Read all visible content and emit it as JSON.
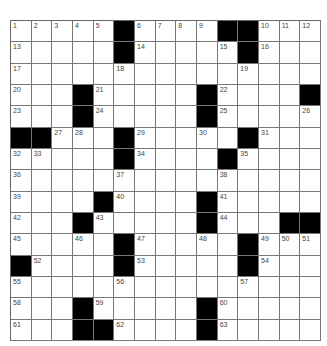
{
  "puzzle": {
    "rows": 15,
    "cols": 15,
    "colors": {
      "black": "#000000",
      "white": "#ffffff",
      "grid_line": "#777777",
      "number": "#444444"
    },
    "layout": [
      "11111011110001 11",
      "",
      "",
      "",
      "",
      "",
      "",
      "",
      "",
      "",
      "",
      "",
      "",
      "",
      ""
    ],
    "grid": [
      [
        1,
        2,
        3,
        4,
        5,
        "#",
        6,
        7,
        8,
        9,
        "#",
        "#",
        10,
        11,
        12
      ],
      [
        13,
        0,
        0,
        0,
        0,
        "#",
        14,
        0,
        0,
        0,
        15,
        "#",
        16,
        0,
        0
      ],
      [
        17,
        0,
        0,
        0,
        0,
        18,
        0,
        0,
        0,
        0,
        0,
        19,
        0,
        0,
        0
      ],
      [
        20,
        0,
        0,
        "#",
        21,
        0,
        0,
        0,
        0,
        "#",
        22,
        0,
        0,
        0,
        "#"
      ],
      [
        23,
        0,
        0,
        "#",
        24,
        0,
        0,
        0,
        0,
        "#",
        25,
        0,
        0,
        0,
        26
      ],
      [
        "#",
        "#",
        27,
        28,
        0,
        "#",
        29,
        0,
        0,
        30,
        0,
        "#",
        31,
        0,
        0
      ],
      [
        32,
        33,
        0,
        0,
        0,
        "#",
        34,
        0,
        0,
        0,
        "#",
        35,
        0,
        0,
        0
      ],
      [
        36,
        0,
        0,
        0,
        0,
        37,
        0,
        0,
        0,
        0,
        38,
        0,
        0,
        0,
        0
      ],
      [
        39,
        0,
        0,
        0,
        "#",
        40,
        0,
        0,
        0,
        "#",
        41,
        0,
        0,
        0,
        0
      ],
      [
        42,
        0,
        0,
        "#",
        43,
        0,
        0,
        0,
        0,
        "#",
        44,
        0,
        0,
        "#",
        "#"
      ],
      [
        45,
        0,
        0,
        46,
        0,
        "#",
        47,
        0,
        0,
        48,
        0,
        "#",
        49,
        50,
        51
      ],
      [
        "#",
        52,
        0,
        0,
        0,
        "#",
        53,
        0,
        0,
        0,
        0,
        "#",
        54,
        0,
        0
      ],
      [
        55,
        0,
        0,
        0,
        0,
        56,
        0,
        0,
        0,
        0,
        0,
        57,
        0,
        0,
        0
      ],
      [
        58,
        0,
        0,
        "#",
        59,
        0,
        0,
        0,
        0,
        "#",
        60,
        0,
        0,
        0,
        0
      ],
      [
        61,
        0,
        0,
        "#",
        "#",
        62,
        0,
        0,
        0,
        "#",
        63,
        0,
        0,
        0,
        0
      ]
    ]
  }
}
